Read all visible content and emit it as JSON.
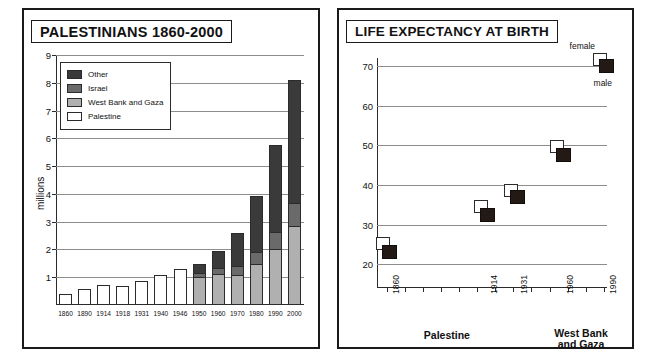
{
  "left_panel": {
    "title": "PALESTINIANS  1860-2000",
    "ylabel": "millions",
    "legend": [
      {
        "label": "Other",
        "color": "#3a3a3a"
      },
      {
        "label": "Israel",
        "color": "#6a6a6a"
      },
      {
        "label": "West Bank and Gaza",
        "color": "#b0b0b0"
      },
      {
        "label": "Palestine",
        "color": "#ffffff"
      }
    ],
    "ytick_labels": [
      "1",
      "2",
      "3",
      "4",
      "5",
      "6",
      "7",
      "8",
      "9"
    ]
  },
  "right_panel": {
    "title": "LIFE EXPECTANCY AT BIRTH",
    "ytick_labels": [
      "20",
      "30",
      "40",
      "50",
      "60",
      "70"
    ],
    "point_labels": {
      "female": "female",
      "male": "male"
    },
    "group_labels": [
      "Palestine",
      "West Bank\nand Gaza"
    ]
  },
  "chart_data": [
    {
      "type": "bar",
      "id": "palestinians-population",
      "title": "PALESTINIANS  1860-2000",
      "xlabel": "",
      "ylabel": "millions",
      "ylim": [
        0,
        9
      ],
      "yticks": [
        1,
        2,
        3,
        4,
        5,
        6,
        7,
        8,
        9
      ],
      "grid": true,
      "stacked": true,
      "legend_position": "top-left-inside",
      "categories": [
        "1860",
        "1890",
        "1914",
        "1918",
        "1931",
        "1940",
        "1946",
        "1950",
        "1960",
        "1970",
        "1980",
        "1990",
        "2000"
      ],
      "series": [
        {
          "name": "Palestine",
          "color": "#ffffff",
          "values": [
            0.41,
            0.56,
            0.72,
            0.68,
            0.86,
            1.08,
            1.28,
            0,
            0,
            0,
            0,
            0,
            0
          ]
        },
        {
          "name": "West Bank and Gaza",
          "color": "#b0b0b0",
          "values": [
            0,
            0,
            0,
            0,
            0,
            0,
            0,
            0.97,
            1.1,
            1.05,
            1.42,
            1.98,
            2.78
          ]
        },
        {
          "name": "Israel",
          "color": "#6a6a6a",
          "values": [
            0,
            0,
            0,
            0,
            0,
            0,
            0,
            0.18,
            0.22,
            0.32,
            0.45,
            0.62,
            0.87
          ]
        },
        {
          "name": "Other",
          "color": "#3a3a3a",
          "values": [
            0,
            0,
            0,
            0,
            0,
            0,
            0,
            0.33,
            0.63,
            1.23,
            2.05,
            3.15,
            4.45
          ]
        }
      ],
      "totals": [
        0.41,
        0.56,
        0.72,
        0.68,
        0.86,
        1.08,
        1.28,
        1.48,
        1.95,
        2.6,
        3.92,
        5.75,
        8.1
      ]
    },
    {
      "type": "scatter",
      "id": "life-expectancy-at-birth",
      "title": "LIFE EXPECTANCY AT BIRTH",
      "xlabel": "",
      "ylabel": "",
      "ylim": [
        14,
        72
      ],
      "yticks": [
        20,
        30,
        40,
        50,
        60,
        70
      ],
      "grid": true,
      "annotations": [
        "female",
        "male"
      ],
      "group_labels": [
        "Palestine",
        "West Bank and Gaza"
      ],
      "x": [
        "1860",
        "1914",
        "1931",
        "1960",
        "1990"
      ],
      "series": [
        {
          "name": "female",
          "color": "#ffffff",
          "values": [
            25.0,
            34.5,
            38.5,
            49.5,
            71.5
          ]
        },
        {
          "name": "male",
          "color": "#231a16",
          "values": [
            23.0,
            32.5,
            37.0,
            47.5,
            70.0
          ]
        }
      ]
    }
  ]
}
